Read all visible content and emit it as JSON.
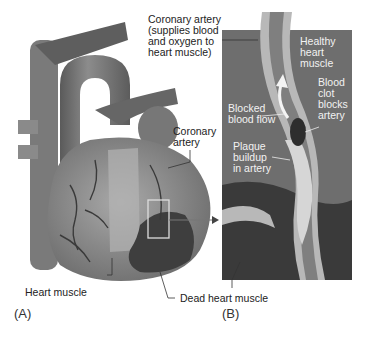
{
  "figure": {
    "panel_a": {
      "letter": "(A)",
      "labels": {
        "coronary_artery_top": "Coronary artery\n(supplies blood\nand oxygen to\nheart muscle)",
        "coronary_artery": "Coronary\nartery",
        "heart_muscle": "Heart muscle",
        "dead_heart_muscle": "Dead heart muscle"
      }
    },
    "panel_b": {
      "letter": "(B)",
      "labels": {
        "healthy_heart_muscle": "Healthy\nheart\nmuscle",
        "blood_clot": "Blood\nclot\nblocks\nartery",
        "blocked_blood_flow": "Blocked\nblood flow",
        "plaque_buildup": "Plaque\nbuildup\nin artery"
      }
    },
    "colors": {
      "panel_bg": "#6e6e6e",
      "dead_muscle": "#3a3a3a",
      "heart_body": "#9a9a9a",
      "vessel_wall": "#b8b8b8",
      "plaque": "#d6d6d6"
    }
  }
}
